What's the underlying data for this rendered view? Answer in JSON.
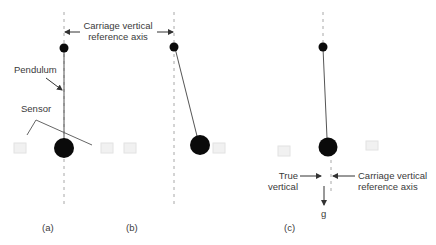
{
  "figure": {
    "colors": {
      "background": "#ffffff",
      "line": "#555555",
      "axis_dash": "#a0a0a0",
      "mass": "#0a0a0a",
      "sensor": "#ececec",
      "text": "#3a3a3a"
    },
    "top_annotation": {
      "line1": "Carriage vertical",
      "line2": "reference axis"
    },
    "panel_a": {
      "caption": "(a)",
      "pendulum_label": "Pendulum",
      "sensor_label": "Sensor"
    },
    "panel_b": {
      "caption": "(b)"
    },
    "panel_c": {
      "caption": "(c)",
      "true_vertical": {
        "line1": "True",
        "line2": "vertical"
      },
      "carriage_axis": {
        "line1": "Carriage vertical",
        "line2": "reference axis"
      },
      "gravity_label": "g"
    }
  }
}
